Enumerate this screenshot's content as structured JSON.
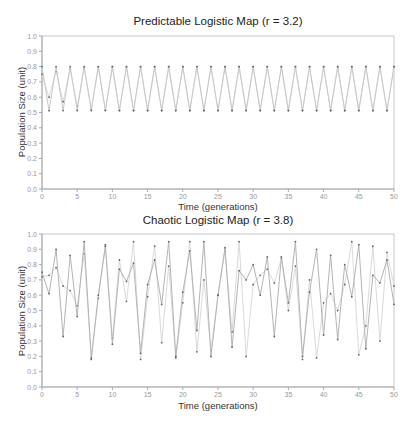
{
  "chart_data": [
    {
      "type": "line",
      "title": "Predictable Logistic Map (r = 3.2)",
      "xlabel": "Time (generations)",
      "ylabel": "Population Size (unit)",
      "xlim": [
        0,
        50
      ],
      "ylim": [
        0,
        1.0
      ],
      "xticks": [
        0,
        5,
        10,
        15,
        20,
        25,
        30,
        35,
        40,
        45,
        50
      ],
      "yticks": [
        0.0,
        0.1,
        0.2,
        0.3,
        0.4,
        0.5,
        0.6,
        0.7,
        0.8,
        0.9,
        1.0
      ],
      "grid": false,
      "legend": null,
      "series": [
        {
          "name": "series_a",
          "x0": 0.8,
          "r": 3.2,
          "color": "#c8c8c8",
          "values": [
            0.8,
            0.512,
            0.7995,
            0.5129,
            0.7995,
            0.513,
            0.7995,
            0.513,
            0.7995,
            0.513,
            0.7995,
            0.513,
            0.7995,
            0.513,
            0.7995,
            0.513,
            0.7995,
            0.513,
            0.7995,
            0.513,
            0.7995,
            0.513,
            0.7995,
            0.513,
            0.7995,
            0.513,
            0.7995,
            0.513,
            0.7995,
            0.513,
            0.7995,
            0.513,
            0.7995,
            0.513,
            0.7995,
            0.513,
            0.7995,
            0.513,
            0.7995,
            0.513,
            0.7995,
            0.513,
            0.7995,
            0.513,
            0.7995,
            0.513,
            0.7995,
            0.513,
            0.7995,
            0.513,
            0.7995
          ]
        },
        {
          "name": "series_b",
          "x0": 0.75,
          "r": 3.2,
          "color": "#dcdcdc",
          "values": [
            0.75,
            0.6,
            0.768,
            0.5702,
            0.7842,
            0.5414,
            0.7945,
            0.5224,
            0.7984,
            0.5151,
            0.7993,
            0.5133,
            0.7995,
            0.513,
            0.7995,
            0.513,
            0.7995,
            0.513,
            0.7995,
            0.513,
            0.7995,
            0.513,
            0.7995,
            0.513,
            0.7995,
            0.513,
            0.7995,
            0.513,
            0.7995,
            0.513,
            0.7995,
            0.513,
            0.7995,
            0.513,
            0.7995,
            0.513,
            0.7995,
            0.513,
            0.7995,
            0.513,
            0.7995,
            0.513,
            0.7995,
            0.513,
            0.7995,
            0.513,
            0.7995,
            0.513,
            0.7995,
            0.513,
            0.7995
          ]
        }
      ]
    },
    {
      "type": "line",
      "title": "Chaotic Logistic Map (r = 3.8)",
      "xlabel": "Time (generations)",
      "ylabel": "Population Size (unit)",
      "xlim": [
        0,
        50
      ],
      "ylim": [
        0,
        1.0
      ],
      "xticks": [
        0,
        5,
        10,
        15,
        20,
        25,
        30,
        35,
        40,
        45,
        50
      ],
      "yticks": [
        0.0,
        0.1,
        0.2,
        0.3,
        0.4,
        0.5,
        0.6,
        0.7,
        0.8,
        0.9,
        1.0
      ],
      "grid": false,
      "legend": null,
      "series": [
        {
          "name": "series_a",
          "color": "#b4b4b4",
          "values": [
            0.75,
            0.61,
            0.9,
            0.33,
            0.86,
            0.46,
            0.95,
            0.19,
            0.6,
            0.92,
            0.28,
            0.77,
            0.69,
            0.81,
            0.22,
            0.67,
            0.83,
            0.54,
            0.95,
            0.2,
            0.62,
            0.89,
            0.37,
            0.95,
            0.2,
            0.6,
            0.91,
            0.26,
            0.76,
            0.7,
            0.8,
            0.6,
            0.85,
            0.33,
            0.85,
            0.55,
            0.95,
            0.2,
            0.62,
            0.9,
            0.34,
            0.86,
            0.31,
            0.8,
            0.59,
            0.93,
            0.25,
            0.73,
            0.68,
            0.83,
            0.54
          ]
        },
        {
          "name": "series_b",
          "color": "#dadada",
          "values": [
            0.72,
            0.73,
            0.78,
            0.66,
            0.63,
            0.53,
            0.87,
            0.18,
            0.58,
            0.93,
            0.32,
            0.83,
            0.56,
            0.95,
            0.18,
            0.59,
            0.92,
            0.29,
            0.79,
            0.19,
            0.55,
            0.95,
            0.23,
            0.7,
            0.24,
            0.6,
            0.89,
            0.36,
            0.95,
            0.2,
            0.67,
            0.73,
            0.77,
            0.68,
            0.84,
            0.5,
            0.79,
            0.18,
            0.7,
            0.19,
            0.55,
            0.61,
            0.5,
            0.67,
            0.95,
            0.21,
            0.4,
            0.92,
            0.3,
            0.88,
            0.66
          ]
        }
      ]
    }
  ]
}
